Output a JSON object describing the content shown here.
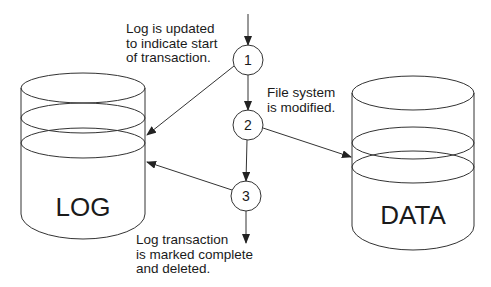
{
  "diagram": {
    "type": "transaction-logging-flow",
    "stroke_color": "#333333",
    "background": "#ffffff"
  },
  "cylinders": {
    "log": {
      "label": "LOG"
    },
    "data": {
      "label": "DATA"
    }
  },
  "steps": [
    {
      "number": "1"
    },
    {
      "number": "2"
    },
    {
      "number": "3"
    }
  ],
  "annotations": {
    "step1": [
      "Log is updated",
      "to indicate start",
      "of transaction."
    ],
    "step2": [
      "File system",
      "is modified."
    ],
    "step3": [
      "Log transaction",
      "is marked complete",
      "and deleted."
    ]
  },
  "arrows": [
    {
      "from": "entry",
      "to": "step-1"
    },
    {
      "from": "step-1",
      "to": "step-2"
    },
    {
      "from": "step-1",
      "to": "log"
    },
    {
      "from": "step-2",
      "to": "data"
    },
    {
      "from": "step-2",
      "to": "step-3"
    },
    {
      "from": "step-3",
      "to": "log"
    },
    {
      "from": "step-3",
      "to": "exit"
    }
  ]
}
